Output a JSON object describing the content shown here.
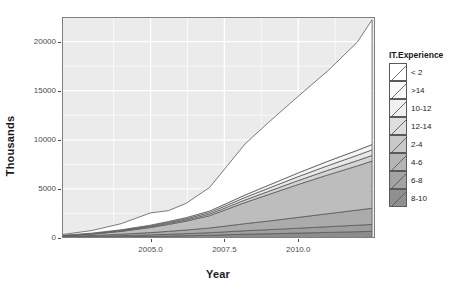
{
  "chart_data": {
    "type": "area",
    "stacked": true,
    "title": "",
    "xlabel": "Year",
    "ylabel": "Thousands",
    "xlim": [
      2002.0,
      2012.6
    ],
    "ylim": [
      0,
      22500
    ],
    "xticks": [
      "2005.0",
      "2007.5",
      "2010.0"
    ],
    "xtick_values": [
      2005.0,
      2007.5,
      2010.0
    ],
    "yticks": [
      "0",
      "5000",
      "10000",
      "15000",
      "20000"
    ],
    "ytick_values": [
      0,
      5000,
      10000,
      15000,
      20000
    ],
    "grid": "white gridlines on light gray panel",
    "legend_title": "IT.Experience",
    "legend_position": "right",
    "x": [
      2002.0,
      2003.0,
      2004.0,
      2005.0,
      2005.6,
      2006.2,
      2007.0,
      2007.6,
      2008.2,
      2009.0,
      2010.0,
      2011.0,
      2012.0,
      2012.5
    ],
    "series": [
      {
        "name": "8-10",
        "color": "#8c8c8c",
        "stack_order": 1,
        "values": [
          60,
          90,
          130,
          170,
          200,
          230,
          280,
          330,
          380,
          430,
          500,
          570,
          640,
          680
        ]
      },
      {
        "name": "6-8",
        "color": "#9e9e9e",
        "stack_order": 2,
        "values": [
          40,
          70,
          110,
          150,
          180,
          210,
          260,
          310,
          360,
          420,
          500,
          580,
          660,
          700
        ]
      },
      {
        "name": "4-6",
        "color": "#ababab",
        "stack_order": 3,
        "values": [
          50,
          90,
          150,
          230,
          300,
          370,
          480,
          600,
          720,
          880,
          1100,
          1320,
          1540,
          1650
        ]
      },
      {
        "name": "2-4",
        "color": "#bdbdbd",
        "stack_order": 4,
        "values": [
          60,
          140,
          280,
          520,
          700,
          900,
          1250,
          1700,
          2150,
          2700,
          3350,
          3950,
          4500,
          4800
        ]
      },
      {
        "name": "12-14",
        "color": "#d4d4d4",
        "stack_order": 5,
        "values": [
          20,
          35,
          55,
          80,
          100,
          120,
          160,
          210,
          260,
          320,
          400,
          470,
          540,
          570
        ]
      },
      {
        "name": "10-12",
        "color": "#e8e8e8",
        "stack_order": 6,
        "values": [
          20,
          35,
          55,
          80,
          100,
          120,
          160,
          210,
          260,
          320,
          400,
          470,
          540,
          570
        ]
      },
      {
        "name": ">14",
        "color": "#f5f5f5",
        "stack_order": 7,
        "values": [
          20,
          35,
          55,
          80,
          100,
          120,
          160,
          200,
          250,
          310,
          380,
          450,
          510,
          540
        ]
      },
      {
        "name": "< 2",
        "color": "#ffffff",
        "stack_order": 8,
        "values": [
          80,
          260,
          620,
          1250,
          1100,
          1450,
          2400,
          3800,
          5200,
          6400,
          7800,
          9200,
          11000,
          12700
        ]
      }
    ],
    "legend_entries": [
      {
        "label": "< 2",
        "color": "#ffffff"
      },
      {
        "label": ">14",
        "color": "#fafafa"
      },
      {
        "label": "10-12",
        "color": "#f0f0f0"
      },
      {
        "label": "12-14",
        "color": "#dedede"
      },
      {
        "label": "2-4",
        "color": "#c9c9c9"
      },
      {
        "label": "4-6",
        "color": "#b5b5b5"
      },
      {
        "label": "6-8",
        "color": "#a3a3a3"
      },
      {
        "label": "8-10",
        "color": "#8f8f8f"
      }
    ]
  },
  "panel": {
    "background": "#ebebeb",
    "gridline_color": "#ffffff",
    "border_color": "#7f7f7f"
  },
  "axes": {
    "y_title": "Thousands",
    "x_title": "Year",
    "tick_color": "#4d4d4d"
  },
  "legend": {
    "title": "IT.Experience"
  }
}
